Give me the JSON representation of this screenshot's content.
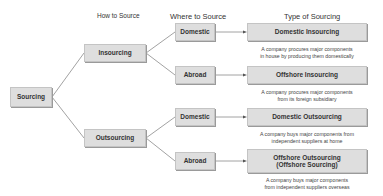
{
  "headers": {
    "how": "How to Source",
    "where": "Where to Source",
    "type": "Type of Sourcing"
  },
  "root": {
    "label": "Sourcing"
  },
  "how": [
    {
      "label": "Insourcing"
    },
    {
      "label": "Outsourcing"
    }
  ],
  "where": [
    {
      "label": "Domestic"
    },
    {
      "label": "Abroad"
    },
    {
      "label": "Domestic"
    },
    {
      "label": "Abroad"
    }
  ],
  "types": [
    {
      "label": "Domestic Insourcing",
      "desc1": "A company procures major components",
      "desc2": "in house by producing them domestically"
    },
    {
      "label": "Offshore Insourcing",
      "desc1": "A company procures major components",
      "desc2": "from its foreign subsidiary"
    },
    {
      "label": "Domestic Outsourcing",
      "desc1": "A company buys major components from",
      "desc2": "independent suppliers at home"
    },
    {
      "label": "Offshore Outsourcing",
      "label2": "(Offshore Sourcing)",
      "desc1": "A company buys major components",
      "desc2": "from independent suppliers overseas"
    }
  ],
  "colors": {
    "box_fill": "#dedede",
    "box_border": "#c4c4c4",
    "line": "#888888",
    "text": "#333333"
  }
}
